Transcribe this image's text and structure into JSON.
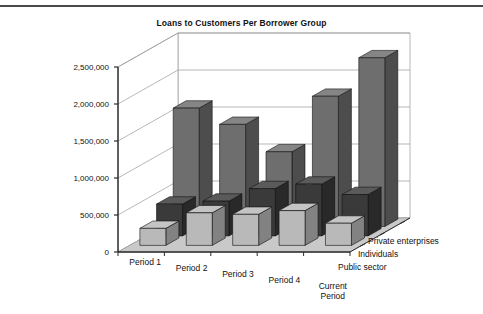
{
  "chart_data": {
    "type": "bar",
    "title": "Loans to Customers Per Borrower Group",
    "xlabel": "",
    "ylabel": "",
    "projection": "3d-grouped-depth",
    "categories": [
      "Period 1",
      "Period 2",
      "Period 3",
      "Period 4",
      "Current Period"
    ],
    "series": [
      {
        "name": "Private enterprises",
        "color": "#6e6e6e",
        "values": [
          1600000,
          1380000,
          1010000,
          1760000,
          2280000
        ]
      },
      {
        "name": "Individuals",
        "color": "#3a3a3a",
        "values": [
          430000,
          470000,
          640000,
          700000,
          560000
        ]
      },
      {
        "name": "Public sector",
        "color": "#b9b9b9",
        "values": [
          230000,
          440000,
          420000,
          470000,
          300000
        ]
      }
    ],
    "yticks": [
      0,
      500000,
      1000000,
      1500000,
      2000000,
      2500000
    ],
    "ytick_labels": [
      "0",
      "500,000",
      "1,000,000",
      "1,500,000",
      "2,000,000",
      "2,500,000"
    ],
    "ylim": [
      0,
      2500000
    ],
    "grid": true,
    "legend_position": "depth-axis-right",
    "colors": {
      "private_enterprises": "#6e6e6e",
      "individuals": "#3a3a3a",
      "public_sector": "#b9b9b9",
      "floor": "#c9c9c9",
      "wall": "#ffffff",
      "axis_line": "#2b2b2b",
      "grid_line": "#9a9a9a",
      "title_text": "#121212",
      "rule": "#4a4a4a"
    }
  }
}
